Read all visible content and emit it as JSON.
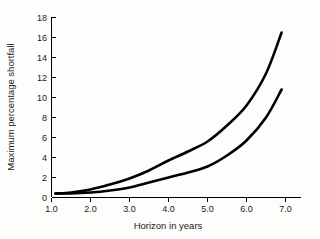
{
  "chart_data": {
    "type": "line",
    "title": "",
    "subtitle": "",
    "xlabel": "Horizon in years",
    "ylabel": "Maximum percentage shortfall",
    "xlim": [
      1.0,
      7.4
    ],
    "ylim": [
      0,
      18
    ],
    "xticks": [
      "1.0",
      "2.0",
      "3.0",
      "4.0",
      "5.0",
      "6.0",
      "7.0"
    ],
    "xtick_values": [
      1.0,
      2.0,
      3.0,
      4.0,
      5.0,
      6.0,
      7.0
    ],
    "yticks": [
      "0",
      "2",
      "4",
      "6",
      "8",
      "10",
      "12",
      "14",
      "16",
      "18"
    ],
    "ytick_values": [
      0,
      2,
      4,
      6,
      8,
      10,
      12,
      14,
      16,
      18
    ],
    "grid": false,
    "legend": "none",
    "annotations": [],
    "x": [
      1.1,
      1.5,
      2.0,
      2.5,
      3.0,
      3.5,
      4.0,
      4.5,
      5.0,
      5.5,
      6.0,
      6.5,
      6.9
    ],
    "series": [
      {
        "name": "upper-curve",
        "color": "#000000",
        "values": [
          0.4,
          0.5,
          0.8,
          1.3,
          1.9,
          2.7,
          3.7,
          4.6,
          5.6,
          7.2,
          9.2,
          12.4,
          16.5
        ]
      },
      {
        "name": "lower-curve",
        "color": "#000000",
        "values": [
          0.4,
          0.4,
          0.5,
          0.7,
          1.0,
          1.5,
          2.0,
          2.5,
          3.1,
          4.2,
          5.7,
          8.0,
          10.8
        ]
      }
    ]
  },
  "axes": {
    "x_axis_name": "horizon-axis",
    "y_axis_name": "shortfall-axis"
  },
  "colors": {
    "background": "#fdfdfb",
    "axis": "#000000",
    "curve": "#000000",
    "text": "#1a1a1a"
  }
}
